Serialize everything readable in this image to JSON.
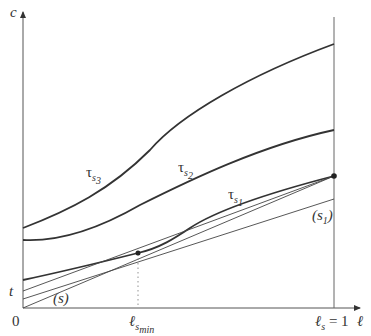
{
  "axes": {
    "y_label": "c",
    "x_label": "ℓ",
    "origin_label": "0",
    "t_label": "t"
  },
  "curves": {
    "tau_s3": {
      "symbol": "τ",
      "sub": "s",
      "subsub": "3"
    },
    "tau_s2": {
      "symbol": "τ",
      "sub": "s",
      "subsub": "2"
    },
    "tau_s1": {
      "symbol": "τ",
      "sub": "s",
      "subsub": "1"
    }
  },
  "lines": {
    "s": {
      "label": "(s)"
    },
    "s1": {
      "label_open": "(",
      "label_main": "s",
      "label_sub": "1",
      "label_close": ")"
    }
  },
  "x_ticks": {
    "l_smin": {
      "main": "ℓ",
      "sub": "s",
      "subsub": "min"
    },
    "l_s_eq_1": {
      "main": "ℓ",
      "sub": "s",
      "rest": " = 1"
    }
  },
  "colors": {
    "stroke": "#333333",
    "axis": "#555555",
    "background": "#ffffff"
  }
}
